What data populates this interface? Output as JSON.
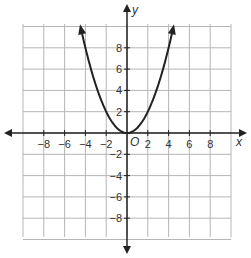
{
  "chart_data": {
    "type": "line",
    "title": "",
    "xlabel": "x",
    "ylabel": "y",
    "origin_label": "O",
    "xlim": [
      -10,
      10
    ],
    "ylim": [
      -10,
      10
    ],
    "grid": true,
    "grid_step": 2,
    "x_ticks": [
      -8,
      -6,
      -4,
      -2,
      2,
      4,
      6,
      8
    ],
    "y_ticks": [
      -8,
      -6,
      -4,
      -2,
      2,
      4,
      6,
      8
    ],
    "x_tick_labels": [
      "−8",
      "−6",
      "−4",
      "−2",
      "2",
      "4",
      "6",
      "8"
    ],
    "y_tick_labels": [
      "−8",
      "−6",
      "−4",
      "−2",
      "2",
      "4",
      "6",
      "8"
    ],
    "series": [
      {
        "name": "y = 0.5x^2",
        "equation": "y = x^2 / 2",
        "x": [
          -4.47,
          -4,
          -3,
          -2,
          -1,
          0,
          1,
          2,
          3,
          4,
          4.47
        ],
        "y": [
          10,
          8,
          4.5,
          2,
          0.5,
          0,
          0.5,
          2,
          4.5,
          8,
          10
        ],
        "arrows_at_ends": true
      }
    ],
    "colors": {
      "grid": "#b5b5b5",
      "axis": "#222222",
      "curve": "#222222"
    }
  }
}
